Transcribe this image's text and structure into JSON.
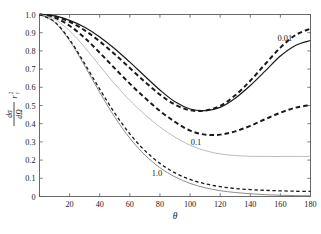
{
  "figure": {
    "background_color": "#ffffff",
    "frame_color": "#5a5a5a",
    "tick_color": "#5a5a5a"
  },
  "axes": {
    "x": {
      "label": "θ",
      "ticks": [
        0,
        20,
        40,
        60,
        80,
        100,
        120,
        140,
        160,
        180
      ],
      "tick_labels": [
        "0",
        "20",
        "40",
        "60",
        "80",
        "100",
        "120",
        "140",
        "160",
        "180"
      ],
      "min": 0,
      "max": 180
    },
    "y": {
      "label_numerator": "dσ",
      "label_denominator": "dΩ",
      "label_divisor": "r",
      "label_divisor_sub": "c",
      "label_divisor_sup": "2",
      "ticks": [
        0,
        0.1,
        0.2,
        0.3,
        0.4,
        0.5,
        0.6,
        0.7,
        0.8,
        0.9,
        1.0
      ],
      "tick_labels": [
        "0",
        "0.1",
        "0.2",
        "0.3",
        "0.4",
        "0.5",
        "0.6",
        "0.7",
        "0.8",
        "0.9",
        "1.0"
      ],
      "min": 0,
      "max": 1.0
    }
  },
  "annotations": [
    {
      "name": "label-001",
      "text": "0.01",
      "x": 163,
      "y": 0.855
    },
    {
      "name": "label-01",
      "text": "0.1",
      "x": 104,
      "y": 0.285
    },
    {
      "name": "label-10",
      "text": "1.0",
      "x": 78,
      "y": 0.115
    }
  ],
  "chart_data": {
    "type": "line",
    "title": "",
    "xlabel": "θ",
    "ylabel": "dσ/dΩ / r_c^2",
    "xlim": [
      0,
      180
    ],
    "ylim": [
      0,
      1.0
    ],
    "grid": false,
    "legend": "inline-annotations",
    "x": [
      0,
      10,
      20,
      30,
      40,
      50,
      60,
      70,
      80,
      90,
      100,
      110,
      120,
      130,
      140,
      150,
      160,
      170,
      180
    ],
    "series": [
      {
        "name": "0.01 solid (dark)",
        "label": "0.01",
        "style": "solid",
        "color": "#1a1a1a",
        "width": 1.2,
        "values": [
          1.0,
          0.992,
          0.968,
          0.93,
          0.877,
          0.812,
          0.738,
          0.661,
          0.585,
          0.52,
          0.481,
          0.472,
          0.49,
          0.54,
          0.61,
          0.69,
          0.772,
          0.83,
          0.857
        ]
      },
      {
        "name": "0.01 dashed (thick)",
        "label": "0.01",
        "style": "dashed",
        "color": "#1a1a1a",
        "width": 2.0,
        "values": [
          1.0,
          0.99,
          0.96,
          0.913,
          0.852,
          0.782,
          0.706,
          0.63,
          0.56,
          0.505,
          0.474,
          0.472,
          0.498,
          0.556,
          0.636,
          0.728,
          0.818,
          0.887,
          0.922
        ]
      },
      {
        "name": "0.1 dashed (thick)",
        "label": "0.1",
        "style": "dashed",
        "color": "#1a1a1a",
        "width": 2.0,
        "values": [
          1.0,
          0.983,
          0.938,
          0.872,
          0.79,
          0.704,
          0.62,
          0.542,
          0.47,
          0.41,
          0.362,
          0.34,
          0.34,
          0.358,
          0.388,
          0.425,
          0.46,
          0.488,
          0.502
        ]
      },
      {
        "name": "0.1 solid (light gray)",
        "label": "0.1",
        "style": "solid",
        "color": "#b4b4b4",
        "width": 0.9,
        "values": [
          1.0,
          0.975,
          0.91,
          0.82,
          0.718,
          0.618,
          0.528,
          0.45,
          0.382,
          0.326,
          0.282,
          0.252,
          0.234,
          0.225,
          0.221,
          0.22,
          0.22,
          0.22,
          0.22
        ]
      },
      {
        "name": "1.0 solid (gray)",
        "label": "1.0",
        "style": "solid",
        "color": "#8c8c8c",
        "width": 1.0,
        "values": [
          1.0,
          0.958,
          0.856,
          0.718,
          0.572,
          0.436,
          0.32,
          0.228,
          0.158,
          0.108,
          0.072,
          0.048,
          0.032,
          0.022,
          0.015,
          0.01,
          0.007,
          0.005,
          0.004
        ]
      },
      {
        "name": "1.0 dashed",
        "label": "1.0",
        "style": "dashed",
        "color": "#1a1a1a",
        "width": 1.3,
        "values": [
          1.0,
          0.96,
          0.862,
          0.73,
          0.59,
          0.458,
          0.344,
          0.252,
          0.182,
          0.13,
          0.094,
          0.07,
          0.054,
          0.044,
          0.038,
          0.034,
          0.031,
          0.029,
          0.028
        ]
      }
    ]
  }
}
